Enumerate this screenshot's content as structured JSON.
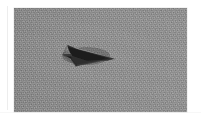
{
  "image": {
    "kind": "photograph",
    "medium": "black-and-white grainy photographic print",
    "width_px": 201,
    "height_px": 124,
    "margin_color": "#ffffff",
    "print_area": {
      "left_px": 14,
      "top_px": 8,
      "width_px": 173,
      "height_px": 104
    }
  },
  "scene": {
    "title": "Dark delta-shaped flying object against overcast sky",
    "background_name": "overcast-gray-sky",
    "background_color": "#8c8c8c",
    "background_description": "featureless uniform gray sky with heavy film grain",
    "grain": "visible",
    "subject": {
      "name": "flying-object",
      "shape": "delta / arrowhead with swept-back wings and notched trailing edge",
      "heading": "pointing right",
      "body_color": "#1d1d1d",
      "highlight_color": "#f2f2f2",
      "shadow_color": "#3a3a3a",
      "center_x_px": 88,
      "center_y_px": 54,
      "width_px": 42,
      "height_px": 18
    }
  },
  "annotations": {
    "visible_text": "",
    "caption": ""
  }
}
